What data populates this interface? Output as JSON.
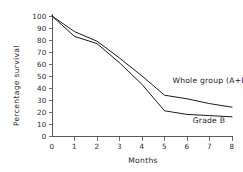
{
  "chart_data": {
    "type": "line",
    "title": "",
    "subtitle": "",
    "xlabel": "Months",
    "ylabel": "Percentage survival",
    "xlim": [
      0,
      8
    ],
    "ylim": [
      0,
      100
    ],
    "grid": false,
    "legend_position": "inline-right",
    "x_ticks": [
      "0",
      "1",
      "2",
      "3",
      "4",
      "5",
      "6",
      "7",
      "8"
    ],
    "x_tick_values": [
      0,
      1,
      2,
      3,
      4,
      5,
      6,
      7,
      8
    ],
    "y_ticks": [
      "0",
      "10",
      "20",
      "30",
      "40",
      "50",
      "60",
      "70",
      "80",
      "90",
      "100"
    ],
    "y_tick_values": [
      0,
      10,
      20,
      30,
      40,
      50,
      60,
      70,
      80,
      90,
      100
    ],
    "x": [
      0,
      1,
      2,
      3,
      4,
      5,
      6,
      7,
      8
    ],
    "series": [
      {
        "name": "Whole group (A+B)",
        "color": "#1a1a1a",
        "label_x": 5.35,
        "label_y": 44,
        "values": [
          100,
          87,
          79,
          65,
          50,
          34,
          31,
          27,
          24
        ]
      },
      {
        "name": "Grade B",
        "color": "#1a1a1a",
        "label_x": 6.25,
        "label_y": 11,
        "values": [
          100,
          83,
          77,
          61,
          43,
          21,
          18,
          17,
          16
        ]
      }
    ]
  },
  "figure": {
    "background_color": "#ffffff",
    "axis_color": "#4a4a4a",
    "text_color": "#2b2b2b"
  }
}
